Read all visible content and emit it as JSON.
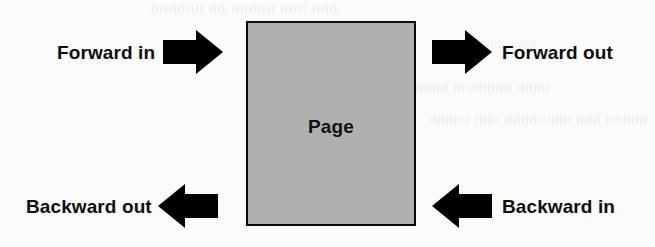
{
  "diagram": {
    "background_color": "#fbfbfb",
    "page": {
      "label": "Page",
      "fill_color": "#b0b0b0",
      "border_color": "#0a0a0a"
    },
    "arrow_color": "#000000",
    "flows": [
      {
        "id": "forward-in",
        "label": "Forward in",
        "direction": "right",
        "icon": "arrow-right-icon",
        "position": "top-left"
      },
      {
        "id": "forward-out",
        "label": "Forward out",
        "direction": "right",
        "icon": "arrow-right-icon",
        "position": "top-right"
      },
      {
        "id": "backward-out",
        "label": "Backward out",
        "direction": "left",
        "icon": "arrow-left-icon",
        "position": "bottom-left"
      },
      {
        "id": "backward-in",
        "label": "Backward in",
        "direction": "left",
        "icon": "arrow-left-icon",
        "position": "bottom-right"
      }
    ],
    "scan_artifacts": [
      "nnn nnn nnnnn nn nnnnnn",
      "nnnn nnnnnnn nnnn",
      "nnnnn nnn nnnnnnnn nnn nnnnn",
      "nnnn nnnn"
    ]
  }
}
